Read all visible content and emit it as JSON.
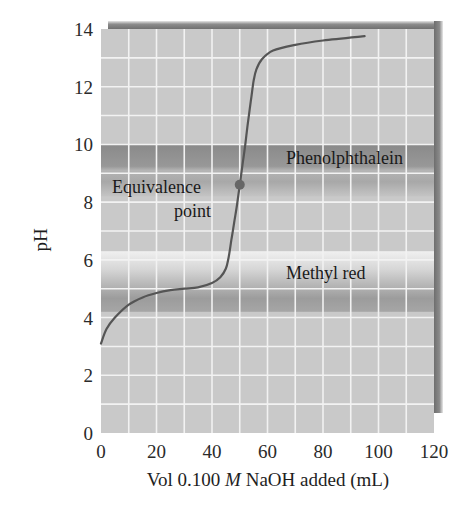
{
  "chart_data": {
    "type": "line",
    "title": "",
    "xlabel_parts": [
      "Vol 0.100 ",
      "M",
      " NaOH added (mL)"
    ],
    "xlabel": "Vol 0.100 M NaOH added (mL)",
    "ylabel": "pH",
    "xlim": [
      0,
      120
    ],
    "ylim": [
      0,
      14
    ],
    "xticks": [
      0,
      20,
      40,
      60,
      80,
      100,
      120
    ],
    "yticks": [
      0,
      2,
      4,
      6,
      8,
      10,
      12,
      14
    ],
    "grid": {
      "on": true,
      "x_step": 10,
      "y_step": 1
    },
    "series": [
      {
        "name": "Titration curve",
        "x": [
          0,
          2,
          5,
          10,
          15,
          20,
          25,
          30,
          35,
          40,
          43,
          45,
          46,
          47,
          48,
          49,
          50,
          51,
          52,
          53,
          54,
          55,
          56,
          58,
          62,
          70,
          80,
          95
        ],
        "y": [
          3.1,
          3.6,
          4.0,
          4.45,
          4.7,
          4.85,
          4.95,
          5.0,
          5.05,
          5.2,
          5.4,
          5.7,
          6.1,
          6.7,
          7.3,
          7.9,
          8.6,
          9.3,
          10.0,
          10.8,
          11.5,
          12.2,
          12.6,
          12.95,
          13.25,
          13.45,
          13.6,
          13.75
        ]
      }
    ],
    "bands": [
      {
        "name": "Phenolphthalein",
        "y_range": [
          8.2,
          10.0
        ]
      },
      {
        "name": "Methyl red",
        "y_range": [
          4.2,
          6.3
        ]
      }
    ],
    "annotations": [
      {
        "text_lines": [
          "Equivalence",
          "point"
        ],
        "x": 50,
        "y": 8.6,
        "marker": "dot"
      },
      {
        "text": "Phenolphthalein",
        "x": 98,
        "y": 9.6
      },
      {
        "text": "Methyl red",
        "x": 86,
        "y": 5.4
      }
    ],
    "colors": {
      "plot_bg": "#c8c8c8",
      "grid": "#f2f2f2",
      "curve": "#555555",
      "dot": "#666666",
      "frame_shadow": "#7a7a7a",
      "band_dark": "#8e8e8e",
      "band_light": "#ececec"
    }
  }
}
